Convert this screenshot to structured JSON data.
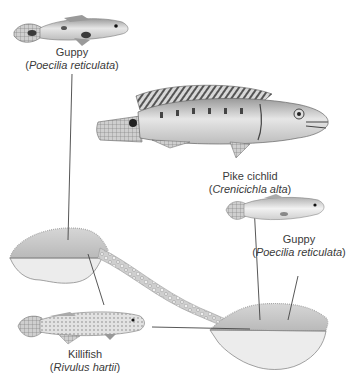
{
  "diagram": {
    "type": "ecology-illustration",
    "species": [
      {
        "id": "guppy-top",
        "common_name": "Guppy",
        "open_paren": "(",
        "scientific_name": "Poecilia reticulata",
        "close_paren": ")",
        "location": "upstream pool"
      },
      {
        "id": "pike-cichlid",
        "common_name": "Pike cichlid",
        "open_paren": "(",
        "scientific_name": "Crenicichla alta",
        "close_paren": ")",
        "location": "downstream pool"
      },
      {
        "id": "guppy-right",
        "common_name": "Guppy",
        "open_paren": "(",
        "scientific_name": "Poecilia reticulata",
        "close_paren": ")",
        "location": "downstream pool"
      },
      {
        "id": "killifish",
        "common_name": "Killifish",
        "open_paren": "(",
        "scientific_name": "Rivulus hartii",
        "close_paren": ")",
        "location": "both pools"
      }
    ],
    "habitats": [
      {
        "id": "upstream-pool",
        "name": "upstream pool"
      },
      {
        "id": "stream",
        "name": "stream with rocks"
      },
      {
        "id": "downstream-pool",
        "name": "downstream pool"
      }
    ],
    "colors": {
      "pool_water": "#c8c8c8",
      "pool_bottom": "#ececec",
      "outline": "#8a8a8a",
      "leader_line": "#444444",
      "text": "#3a3a3a"
    }
  }
}
